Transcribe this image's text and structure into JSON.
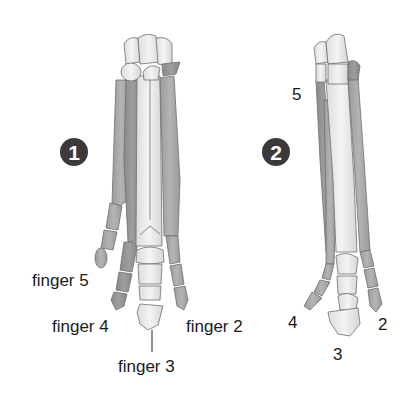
{
  "diagram": {
    "figure_1": {
      "badge": "1",
      "labels": {
        "finger5": "finger 5",
        "finger4": "finger 4",
        "finger3": "finger 3",
        "finger2": "finger 2"
      }
    },
    "figure_2": {
      "badge": "2",
      "labels": {
        "d5": "5",
        "d4": "4",
        "d3": "3",
        "d2": "2"
      }
    },
    "colors": {
      "bone_light": "#eeeeee",
      "bone_mid": "#a8a8a8",
      "bone_dark": "#8c8c8c",
      "outline": "#6e6e6e",
      "badge": "#3a3a3a",
      "text": "#1a1a1a"
    }
  }
}
